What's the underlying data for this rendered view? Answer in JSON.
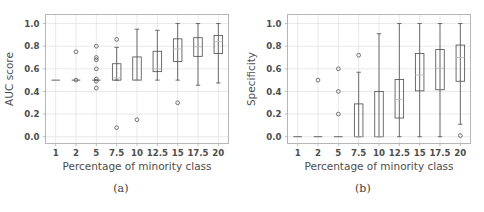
{
  "figure": {
    "width": 484,
    "height": 212,
    "background": "#ffffff",
    "line_color": "#555555",
    "grid_color": "#e3e3e3",
    "frame_color": "#b6b6b6"
  },
  "subfigures": [
    {
      "caption": "(a)",
      "chart_ref": 0
    },
    {
      "caption": "(b)",
      "chart_ref": 1
    }
  ],
  "chart_data": [
    {
      "type": "box",
      "title": "",
      "xlabel": "Percentage of minority class",
      "ylabel": "AUC score",
      "categories": [
        "1",
        "2",
        "5",
        "7.5",
        "10",
        "12.5",
        "15",
        "17.5",
        "20"
      ],
      "xtick_labels": [
        "1",
        "2",
        "5",
        "7.5",
        "10",
        "12.5",
        "15",
        "17.5",
        "20"
      ],
      "ytick_labels": [
        "0.0",
        "0.2",
        "0.4",
        "0.6",
        "0.8",
        "1.0"
      ],
      "yticks": [
        0.0,
        0.2,
        0.4,
        0.6,
        0.8,
        1.0
      ],
      "ylim": [
        -0.06,
        1.08
      ],
      "grid": true,
      "legend": "none",
      "boxes": [
        {
          "category": "1",
          "q1": 0.5,
          "median": 0.5,
          "q3": 0.5,
          "whisker_low": 0.5,
          "whisker_high": 0.5,
          "outliers": []
        },
        {
          "category": "2",
          "q1": 0.5,
          "median": 0.5,
          "q3": 0.5,
          "whisker_low": 0.5,
          "whisker_high": 0.5,
          "outliers": [
            0.75,
            0.5
          ]
        },
        {
          "category": "5",
          "q1": 0.5,
          "median": 0.5,
          "q3": 0.5,
          "whisker_low": 0.5,
          "whisker_high": 0.5,
          "outliers": [
            0.8,
            0.7,
            0.68,
            0.6,
            0.51,
            0.49,
            0.43
          ]
        },
        {
          "category": "7.5",
          "q1": 0.5,
          "median": 0.52,
          "q3": 0.645,
          "whisker_low": 0.5,
          "whisker_high": 0.79,
          "outliers": [
            0.86,
            0.08
          ]
        },
        {
          "category": "10",
          "q1": 0.5,
          "median": 0.5,
          "q3": 0.705,
          "whisker_low": 0.5,
          "whisker_high": 0.95,
          "outliers": [
            0.15
          ]
        },
        {
          "category": "12.5",
          "q1": 0.575,
          "median": 0.6,
          "q3": 0.755,
          "whisker_low": 0.5,
          "whisker_high": 0.94,
          "outliers": []
        },
        {
          "category": "15",
          "q1": 0.665,
          "median": 0.775,
          "q3": 0.865,
          "whisker_low": 0.5,
          "whisker_high": 1.0,
          "outliers": [
            0.3
          ]
        },
        {
          "category": "17.5",
          "q1": 0.71,
          "median": 0.795,
          "q3": 0.875,
          "whisker_low": 0.455,
          "whisker_high": 1.0,
          "outliers": []
        },
        {
          "category": "20",
          "q1": 0.735,
          "median": 0.84,
          "q3": 0.895,
          "whisker_low": 0.475,
          "whisker_high": 1.0,
          "outliers": []
        }
      ]
    },
    {
      "type": "box",
      "title": "",
      "xlabel": "Percentage of minority class",
      "ylabel": "Specificity",
      "categories": [
        "1",
        "2",
        "5",
        "7.5",
        "10",
        "12.5",
        "15",
        "17.5",
        "20"
      ],
      "xtick_labels": [
        "1",
        "2",
        "5",
        "7.5",
        "10",
        "12.5",
        "15",
        "17.5",
        "20"
      ],
      "ytick_labels": [
        "0.0",
        "0.2",
        "0.4",
        "0.6",
        "0.8",
        "1.0"
      ],
      "yticks": [
        0.0,
        0.2,
        0.4,
        0.6,
        0.8,
        1.0
      ],
      "ylim": [
        -0.06,
        1.08
      ],
      "grid": true,
      "legend": "none",
      "boxes": [
        {
          "category": "1",
          "q1": 0.0,
          "median": 0.0,
          "q3": 0.0,
          "whisker_low": 0.0,
          "whisker_high": 0.0,
          "outliers": []
        },
        {
          "category": "2",
          "q1": 0.0,
          "median": 0.0,
          "q3": 0.0,
          "whisker_low": 0.0,
          "whisker_high": 0.0,
          "outliers": [
            0.5
          ]
        },
        {
          "category": "5",
          "q1": 0.0,
          "median": 0.0,
          "q3": 0.0,
          "whisker_low": 0.0,
          "whisker_high": 0.0,
          "outliers": [
            0.6,
            0.4,
            0.2
          ]
        },
        {
          "category": "7.5",
          "q1": 0.0,
          "median": 0.0,
          "q3": 0.29,
          "whisker_low": 0.0,
          "whisker_high": 0.57,
          "outliers": [
            0.72
          ]
        },
        {
          "category": "10",
          "q1": 0.0,
          "median": 0.0,
          "q3": 0.4,
          "whisker_low": 0.0,
          "whisker_high": 0.91,
          "outliers": []
        },
        {
          "category": "12.5",
          "q1": 0.165,
          "median": 0.33,
          "q3": 0.505,
          "whisker_low": 0.0,
          "whisker_high": 1.0,
          "outliers": []
        },
        {
          "category": "15",
          "q1": 0.405,
          "median": 0.545,
          "q3": 0.735,
          "whisker_low": 0.0,
          "whisker_high": 1.0,
          "outliers": []
        },
        {
          "category": "17.5",
          "q1": 0.415,
          "median": 0.605,
          "q3": 0.77,
          "whisker_low": 0.0,
          "whisker_high": 1.0,
          "outliers": []
        },
        {
          "category": "20",
          "q1": 0.49,
          "median": 0.7,
          "q3": 0.81,
          "whisker_low": 0.11,
          "whisker_high": 1.0,
          "outliers": [
            0.01
          ]
        }
      ]
    }
  ]
}
